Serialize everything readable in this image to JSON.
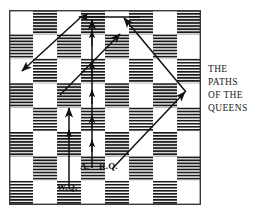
{
  "figure": {
    "title": "THE PATHS OF THE QUEENS",
    "kind": "chess-diagram"
  },
  "caption": {
    "lines": [
      "THE",
      "PATHS",
      "OF THE",
      "QUEENS"
    ],
    "line1": "THE",
    "line2": "PATHS",
    "line3": "OF THE",
    "line4": "QUEENS"
  },
  "board": {
    "files": 8,
    "ranks": 8,
    "light_color": "#ffffff",
    "dark_color": "#1a1a1a",
    "border_color": "#3a3a3a",
    "dark_fill_style": "horizontal-hatch",
    "top_left_square": "light"
  },
  "labels": {
    "advance": "A.",
    "red_queen": "R.Q.",
    "white_queen": "W.Q."
  },
  "paths": {
    "line_color": "#111111",
    "items": [
      {
        "name": "white-queen-vertical-path",
        "label": "W.Q.",
        "direction": "up",
        "kind": "vertical-arrow"
      },
      {
        "name": "alice-vertical-path",
        "label": "A.",
        "direction": "up",
        "kind": "vertical-arrow"
      },
      {
        "name": "red-queen-diagonal-path",
        "label": "R.Q.",
        "direction": "up-right-then-up-left",
        "kind": "diagonal-arrow"
      },
      {
        "name": "upper-diagonal-path",
        "direction": "down-left",
        "kind": "diagonal-arrow"
      },
      {
        "name": "top-horizontal-path",
        "direction": "left",
        "kind": "horizontal-arrow"
      }
    ]
  }
}
